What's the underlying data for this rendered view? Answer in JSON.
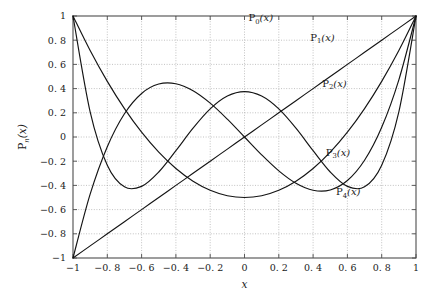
{
  "chart_data": {
    "type": "line",
    "title": "",
    "subtitle": "",
    "xlabel": "x",
    "ylabel": "P_n(x)",
    "xlim": [
      -1,
      1
    ],
    "ylim": [
      -1,
      1
    ],
    "grid": true,
    "legend_position": "inline-annotations",
    "x_ticks": [
      "−1",
      "−0. 8",
      "−0. 6",
      "−0. 4",
      "−0. 2",
      "0",
      "0. 2",
      "0. 4",
      "0. 6",
      "0. 8",
      "1"
    ],
    "x_tick_values": [
      -1,
      -0.8,
      -0.6,
      -0.4,
      -0.2,
      0,
      0.2,
      0.4,
      0.6,
      0.8,
      1
    ],
    "y_ticks": [
      "1",
      "0. 8",
      "0. 6",
      "0. 4",
      "0. 2",
      "0",
      "−0. 2",
      "−0. 4",
      "−0. 6",
      "−0. 8",
      "−1"
    ],
    "y_tick_values": [
      1,
      0.8,
      0.6,
      0.4,
      0.2,
      0,
      -0.2,
      -0.4,
      -0.6,
      -0.8,
      -1
    ],
    "series": [
      {
        "name": "P0(x)",
        "label_base": "P",
        "label_sub": "0",
        "label_arg": "(x)",
        "label_x": 0.095,
        "label_y": 0.955,
        "x": [
          -1,
          -0.9,
          -0.8,
          -0.7,
          -0.6,
          -0.5,
          -0.4,
          -0.3,
          -0.2,
          -0.1,
          0,
          0.1,
          0.2,
          0.3,
          0.4,
          0.5,
          0.6,
          0.7,
          0.8,
          0.9,
          1
        ],
        "values": [
          1,
          1,
          1,
          1,
          1,
          1,
          1,
          1,
          1,
          1,
          1,
          1,
          1,
          1,
          1,
          1,
          1,
          1,
          1,
          1,
          1
        ],
        "drawn": false
      },
      {
        "name": "P1(x)",
        "label_base": "P",
        "label_sub": "1",
        "label_arg": "(x)",
        "label_x": 0.455,
        "label_y": 0.795,
        "x": [
          -1,
          -0.9,
          -0.8,
          -0.7,
          -0.6,
          -0.5,
          -0.4,
          -0.3,
          -0.2,
          -0.1,
          0,
          0.1,
          0.2,
          0.3,
          0.4,
          0.5,
          0.6,
          0.7,
          0.8,
          0.9,
          1
        ],
        "values": [
          -1,
          -0.9,
          -0.8,
          -0.7,
          -0.6,
          -0.5,
          -0.4,
          -0.3,
          -0.2,
          -0.1,
          0,
          0.1,
          0.2,
          0.3,
          0.4,
          0.5,
          0.6,
          0.7,
          0.8,
          0.9,
          1
        ],
        "drawn": true
      },
      {
        "name": "P2(x)",
        "label_base": "P",
        "label_sub": "2",
        "label_arg": "(x)",
        "label_x": 0.525,
        "label_y": 0.415,
        "x": [
          -1,
          -0.9,
          -0.8,
          -0.7,
          -0.6,
          -0.5,
          -0.4,
          -0.3,
          -0.2,
          -0.1,
          0,
          0.1,
          0.2,
          0.3,
          0.4,
          0.5,
          0.6,
          0.7,
          0.8,
          0.9,
          1
        ],
        "values": [
          1,
          0.715,
          0.46,
          0.235,
          0.04,
          -0.125,
          -0.26,
          -0.365,
          -0.44,
          -0.485,
          -0.5,
          -0.485,
          -0.44,
          -0.365,
          -0.26,
          -0.125,
          0.04,
          0.235,
          0.46,
          0.715,
          1
        ],
        "drawn": true
      },
      {
        "name": "P3(x)",
        "label_base": "P",
        "label_sub": "3",
        "label_arg": "(x)",
        "label_x": 0.545,
        "label_y": -0.155,
        "x": [
          -1,
          -0.9,
          -0.8,
          -0.7,
          -0.6,
          -0.5,
          -0.4,
          -0.3,
          -0.2,
          -0.1,
          0,
          0.1,
          0.2,
          0.3,
          0.4,
          0.5,
          0.6,
          0.7,
          0.8,
          0.9,
          1
        ],
        "values": [
          -1,
          -0.4725,
          -0.08,
          0.1925,
          0.36,
          0.4375,
          0.44,
          0.3825,
          0.28,
          0.1475,
          0,
          -0.1475,
          -0.28,
          -0.3825,
          -0.44,
          -0.4375,
          -0.36,
          -0.1925,
          0.08,
          0.4725,
          1
        ],
        "drawn": true
      },
      {
        "name": "P4(x)",
        "label_base": "P",
        "label_sub": "4",
        "label_arg": "(x)",
        "label_x": 0.605,
        "label_y": -0.48,
        "x": [
          -1,
          -0.9,
          -0.8,
          -0.7,
          -0.6,
          -0.5,
          -0.4,
          -0.3,
          -0.2,
          -0.1,
          0,
          0.1,
          0.2,
          0.3,
          0.4,
          0.5,
          0.6,
          0.7,
          0.8,
          0.9,
          1
        ],
        "values": [
          1,
          0.2079,
          -0.233,
          -0.4121,
          -0.408,
          -0.2891,
          -0.113,
          0.0729,
          0.232,
          0.3379,
          0.375,
          0.3379,
          0.232,
          0.0729,
          -0.113,
          -0.2891,
          -0.408,
          -0.4121,
          -0.233,
          0.2079,
          1
        ],
        "drawn": true
      }
    ]
  }
}
